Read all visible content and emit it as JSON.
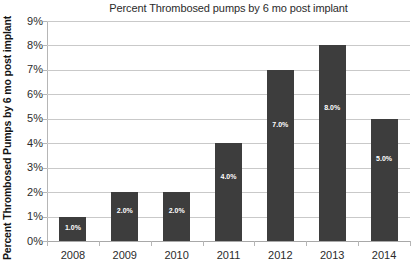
{
  "chart_data": {
    "type": "bar",
    "title": "Percent Thrombosed pumps by 6 mo post implant",
    "xlabel": "",
    "ylabel": "Percent Thrombosed Pumps by 6 mo post implant",
    "categories": [
      "2008",
      "2009",
      "2010",
      "2011",
      "2012",
      "2013",
      "2014"
    ],
    "values": [
      1.0,
      2.0,
      2.0,
      4.0,
      7.0,
      8.0,
      5.0
    ],
    "data_labels": [
      "1.0%",
      "2.0%",
      "2.0%",
      "4.0%",
      "7.0%",
      "8.0%",
      "5.0%"
    ],
    "ylim": [
      0,
      9
    ],
    "ytick_values": [
      0,
      1,
      2,
      3,
      4,
      5,
      6,
      7,
      8,
      9
    ],
    "ytick_labels": [
      "0%",
      "1%",
      "2%",
      "3%",
      "4%",
      "5%",
      "6%",
      "7%",
      "8%",
      "9%"
    ],
    "grid": true,
    "legend": false,
    "series_color": "#3d3d3d",
    "gridline_color": "#c9c9c9",
    "axis_color": "#b6b6b6",
    "label_text_color": "#ffffff",
    "background_color": "#ffffff"
  }
}
